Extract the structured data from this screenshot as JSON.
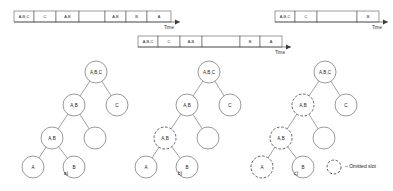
{
  "figure": {
    "caption_labels": [
      "a)",
      "b)",
      "c)"
    ],
    "legend": {
      "symbol": "dashed-circle-icon",
      "text": "– Omitted slot"
    },
    "axis_label": "Time"
  },
  "timelines": [
    {
      "id": "timeline-a",
      "axis_label": "Time",
      "x": 14,
      "y": 11,
      "height": 11,
      "cells": [
        {
          "label": "A,B,C",
          "width": 20
        },
        {
          "label": "C",
          "width": 22
        },
        {
          "label": "A,B",
          "width": 23
        },
        {
          "label": "",
          "width": 26
        },
        {
          "label": "A,B",
          "width": 21
        },
        {
          "label": "B",
          "width": 21
        },
        {
          "label": "A",
          "width": 24
        }
      ]
    },
    {
      "id": "timeline-b",
      "axis_label": "Time",
      "x": 138,
      "y": 36,
      "height": 11,
      "cells": [
        {
          "label": "A,B,C",
          "width": 20
        },
        {
          "label": "C",
          "width": 22
        },
        {
          "label": "A,B",
          "width": 22
        },
        {
          "label": "",
          "width": 38
        },
        {
          "label": "B",
          "width": 20
        },
        {
          "label": "A",
          "width": 22
        }
      ]
    },
    {
      "id": "timeline-c",
      "axis_label": "Time",
      "x": 275,
      "y": 11,
      "height": 11,
      "cells": [
        {
          "label": "A,B,C",
          "width": 20
        },
        {
          "label": "C",
          "width": 22
        },
        {
          "label": "",
          "width": 40
        },
        {
          "label": "B",
          "width": 22
        }
      ]
    }
  ],
  "trees": [
    {
      "id": "tree-a",
      "label": "a)",
      "label_x": 66,
      "label_y": 175,
      "nodes": [
        {
          "name": "root",
          "label": "A,B,C",
          "cx": 96,
          "cy": 72,
          "r": 11,
          "dashed": false
        },
        {
          "name": "ab-level1",
          "label": "A,B",
          "cx": 74,
          "cy": 105,
          "r": 11,
          "dashed": false
        },
        {
          "name": "c-level1",
          "label": "C",
          "cx": 117,
          "cy": 105,
          "r": 11,
          "dashed": false
        },
        {
          "name": "ab-level2",
          "label": "A,B",
          "cx": 52,
          "cy": 138,
          "r": 11,
          "dashed": false
        },
        {
          "name": "empty-level2",
          "label": "",
          "cx": 95,
          "cy": 138,
          "r": 11,
          "dashed": false
        },
        {
          "name": "a-leaf",
          "label": "A",
          "cx": 33,
          "cy": 167,
          "r": 11,
          "dashed": false
        },
        {
          "name": "b-leaf",
          "label": "B",
          "cx": 74,
          "cy": 167,
          "r": 11,
          "dashed": false
        }
      ],
      "edges": [
        [
          96,
          72,
          74,
          105
        ],
        [
          96,
          72,
          117,
          105
        ],
        [
          74,
          105,
          52,
          138
        ],
        [
          74,
          105,
          95,
          138
        ],
        [
          52,
          138,
          33,
          167
        ],
        [
          52,
          138,
          74,
          167
        ]
      ]
    },
    {
      "id": "tree-b",
      "label": "b)",
      "label_x": 180,
      "label_y": 175,
      "nodes": [
        {
          "name": "root",
          "label": "A,B,C",
          "cx": 209,
          "cy": 72,
          "r": 11,
          "dashed": false
        },
        {
          "name": "ab-level1",
          "label": "A,B",
          "cx": 187,
          "cy": 105,
          "r": 11,
          "dashed": false
        },
        {
          "name": "c-level1",
          "label": "C",
          "cx": 230,
          "cy": 105,
          "r": 11,
          "dashed": false
        },
        {
          "name": "ab-level2",
          "label": "A,B",
          "cx": 165,
          "cy": 138,
          "r": 11,
          "dashed": true
        },
        {
          "name": "empty-level2",
          "label": "",
          "cx": 208,
          "cy": 138,
          "r": 11,
          "dashed": false
        },
        {
          "name": "a-leaf",
          "label": "A",
          "cx": 146,
          "cy": 167,
          "r": 11,
          "dashed": false
        },
        {
          "name": "b-leaf",
          "label": "B",
          "cx": 187,
          "cy": 167,
          "r": 11,
          "dashed": false
        }
      ],
      "edges": [
        [
          209,
          72,
          187,
          105
        ],
        [
          209,
          72,
          230,
          105
        ],
        [
          187,
          105,
          165,
          138
        ],
        [
          187,
          105,
          208,
          138
        ],
        [
          165,
          138,
          146,
          167
        ],
        [
          165,
          138,
          187,
          167
        ]
      ]
    },
    {
      "id": "tree-c",
      "label": "c)",
      "label_x": 296,
      "label_y": 175,
      "nodes": [
        {
          "name": "root",
          "label": "A,B,C",
          "cx": 325,
          "cy": 72,
          "r": 11,
          "dashed": false
        },
        {
          "name": "ab-level1",
          "label": "A,B",
          "cx": 303,
          "cy": 105,
          "r": 11,
          "dashed": true
        },
        {
          "name": "c-level1",
          "label": "C",
          "cx": 346,
          "cy": 105,
          "r": 11,
          "dashed": false
        },
        {
          "name": "ab-level2",
          "label": "A,B",
          "cx": 281,
          "cy": 138,
          "r": 11,
          "dashed": true
        },
        {
          "name": "empty-level2",
          "label": "",
          "cx": 324,
          "cy": 138,
          "r": 11,
          "dashed": false
        },
        {
          "name": "a-leaf",
          "label": "A",
          "cx": 262,
          "cy": 167,
          "r": 11,
          "dashed": true
        },
        {
          "name": "b-leaf",
          "label": "B",
          "cx": 303,
          "cy": 167,
          "r": 11,
          "dashed": false
        }
      ],
      "edges": [
        [
          325,
          72,
          303,
          105
        ],
        [
          325,
          72,
          346,
          105
        ],
        [
          303,
          105,
          281,
          138
        ],
        [
          303,
          105,
          324,
          138
        ],
        [
          281,
          138,
          262,
          167
        ],
        [
          281,
          138,
          303,
          167
        ]
      ]
    }
  ],
  "legend_marker": {
    "cx": 334,
    "cy": 167,
    "r": 7,
    "text_x": 345,
    "text_y": 167
  },
  "colors": {
    "stroke": "#555555",
    "cell_stroke": "#3a3a3a",
    "text": "#222222",
    "background": "#ffffff"
  }
}
